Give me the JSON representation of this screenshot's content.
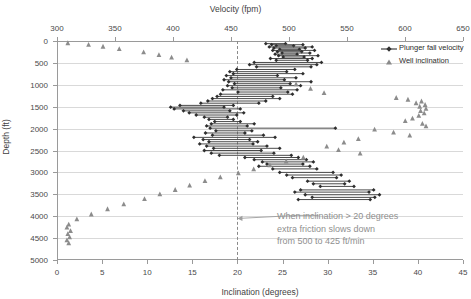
{
  "chart_data": {
    "type": "scatter",
    "title": "",
    "top_axis": {
      "label": "Velocity (fpm)",
      "ticks": [
        300,
        350,
        400,
        450,
        500,
        550,
        600,
        650
      ],
      "range": [
        300,
        650
      ]
    },
    "bottom_axis": {
      "label": "Inclination (degrees)",
      "ticks": [
        0,
        5,
        10,
        15,
        20,
        25,
        30,
        35,
        40,
        45
      ],
      "range": [
        0,
        45
      ]
    },
    "y_axis": {
      "label": "Depth (ft)",
      "ticks": [
        0,
        500,
        1000,
        1500,
        2000,
        2500,
        3000,
        3500,
        4000,
        4500,
        5000
      ],
      "range": [
        0,
        5000
      ],
      "inverted": true
    },
    "grid": true,
    "legend_position": "top-right",
    "legend": [
      {
        "name": "Plunger fall velocity",
        "marker": "line-diamond",
        "color": "#404040"
      },
      {
        "name": "Well inclination",
        "marker": "triangle",
        "color": "#808080"
      }
    ],
    "threshold_line": {
      "axis": "inclination",
      "value": 20,
      "style": "dashed"
    },
    "annotation": {
      "line1": "When inclination > 20 degrees",
      "line2": "extra friction slows down",
      "line3": "from 500 to 425 ft/min",
      "points_to_inclination": 20,
      "points_to_depth": 4050
    },
    "series": [
      {
        "name": "Plunger fall velocity",
        "x_axis": "top",
        "unit": "fpm",
        "points": [
          {
            "depth": 60,
            "v_start": 480,
            "v_end": 497
          },
          {
            "depth": 85,
            "v_start": 485,
            "v_end": 512
          },
          {
            "depth": 110,
            "v_start": 489,
            "v_end": 504
          },
          {
            "depth": 135,
            "v_start": 483,
            "v_end": 520
          },
          {
            "depth": 160,
            "v_start": 487,
            "v_end": 514
          },
          {
            "depth": 190,
            "v_start": 492,
            "v_end": 509
          },
          {
            "depth": 215,
            "v_start": 486,
            "v_end": 522
          },
          {
            "depth": 245,
            "v_start": 490,
            "v_end": 511
          },
          {
            "depth": 275,
            "v_start": 494,
            "v_end": 518
          },
          {
            "depth": 300,
            "v_start": 488,
            "v_end": 507
          },
          {
            "depth": 335,
            "v_start": 491,
            "v_end": 525
          },
          {
            "depth": 365,
            "v_start": 495,
            "v_end": 513
          },
          {
            "depth": 400,
            "v_start": 484,
            "v_end": 520
          },
          {
            "depth": 440,
            "v_start": 489,
            "v_end": 516
          },
          {
            "depth": 490,
            "v_start": 470,
            "v_end": 528
          },
          {
            "depth": 540,
            "v_start": 466,
            "v_end": 524
          },
          {
            "depth": 590,
            "v_start": 472,
            "v_end": 519
          },
          {
            "depth": 650,
            "v_start": 455,
            "v_end": 505
          },
          {
            "depth": 700,
            "v_start": 449,
            "v_end": 498
          },
          {
            "depth": 745,
            "v_start": 452,
            "v_end": 512
          },
          {
            "depth": 790,
            "v_start": 446,
            "v_end": 490
          },
          {
            "depth": 840,
            "v_start": 450,
            "v_end": 506
          },
          {
            "depth": 885,
            "v_start": 444,
            "v_end": 496
          },
          {
            "depth": 930,
            "v_start": 448,
            "v_end": 519
          },
          {
            "depth": 975,
            "v_start": 453,
            "v_end": 501
          },
          {
            "depth": 1020,
            "v_start": 447,
            "v_end": 510
          },
          {
            "depth": 1070,
            "v_start": 451,
            "v_end": 493
          },
          {
            "depth": 1115,
            "v_start": 443,
            "v_end": 507
          },
          {
            "depth": 1165,
            "v_start": 456,
            "v_end": 499
          },
          {
            "depth": 1215,
            "v_start": 441,
            "v_end": 503
          },
          {
            "depth": 1265,
            "v_start": 438,
            "v_end": 486
          },
          {
            "depth": 1315,
            "v_start": 434,
            "v_end": 492
          },
          {
            "depth": 1370,
            "v_start": 430,
            "v_end": 480
          },
          {
            "depth": 1420,
            "v_start": 424,
            "v_end": 474
          },
          {
            "depth": 1470,
            "v_start": 406,
            "v_end": 452
          },
          {
            "depth": 1510,
            "v_start": 398,
            "v_end": 444
          },
          {
            "depth": 1550,
            "v_start": 401,
            "v_end": 458
          },
          {
            "depth": 1595,
            "v_start": 409,
            "v_end": 449
          },
          {
            "depth": 1640,
            "v_start": 414,
            "v_end": 461
          },
          {
            "depth": 1690,
            "v_start": 420,
            "v_end": 455
          },
          {
            "depth": 1740,
            "v_start": 427,
            "v_end": 447
          },
          {
            "depth": 1790,
            "v_start": 431,
            "v_end": 452
          },
          {
            "depth": 1840,
            "v_start": 436,
            "v_end": 458
          },
          {
            "depth": 1890,
            "v_start": 433,
            "v_end": 470
          },
          {
            "depth": 1940,
            "v_start": 429,
            "v_end": 464
          },
          {
            "depth": 1990,
            "v_start": 432,
            "v_end": 540
          },
          {
            "depth": 2050,
            "v_start": 437,
            "v_end": 468
          },
          {
            "depth": 2100,
            "v_start": 428,
            "v_end": 462
          },
          {
            "depth": 2150,
            "v_start": 434,
            "v_end": 478
          },
          {
            "depth": 2200,
            "v_start": 418,
            "v_end": 488
          },
          {
            "depth": 2250,
            "v_start": 426,
            "v_end": 466
          },
          {
            "depth": 2300,
            "v_start": 431,
            "v_end": 473
          },
          {
            "depth": 2350,
            "v_start": 423,
            "v_end": 469
          },
          {
            "depth": 2400,
            "v_start": 429,
            "v_end": 481
          },
          {
            "depth": 2450,
            "v_start": 435,
            "v_end": 492
          },
          {
            "depth": 2500,
            "v_start": 427,
            "v_end": 476
          },
          {
            "depth": 2560,
            "v_start": 433,
            "v_end": 487
          },
          {
            "depth": 2610,
            "v_start": 440,
            "v_end": 502
          },
          {
            "depth": 2660,
            "v_start": 462,
            "v_end": 508
          },
          {
            "depth": 2710,
            "v_start": 470,
            "v_end": 515
          },
          {
            "depth": 2760,
            "v_start": 477,
            "v_end": 521
          },
          {
            "depth": 2810,
            "v_start": 481,
            "v_end": 512
          },
          {
            "depth": 2860,
            "v_start": 474,
            "v_end": 518
          },
          {
            "depth": 2920,
            "v_start": 486,
            "v_end": 524
          },
          {
            "depth": 3000,
            "v_start": 492,
            "v_end": 538
          },
          {
            "depth": 3060,
            "v_start": 498,
            "v_end": 545
          },
          {
            "depth": 3120,
            "v_start": 503,
            "v_end": 541
          },
          {
            "depth": 3200,
            "v_start": 516,
            "v_end": 552
          },
          {
            "depth": 3260,
            "v_start": 521,
            "v_end": 548
          },
          {
            "depth": 3320,
            "v_start": 527,
            "v_end": 556
          },
          {
            "depth": 3400,
            "v_start": 510,
            "v_end": 573
          },
          {
            "depth": 3450,
            "v_start": 505,
            "v_end": 569
          },
          {
            "depth": 3510,
            "v_start": 514,
            "v_end": 578
          },
          {
            "depth": 3570,
            "v_start": 520,
            "v_end": 574
          },
          {
            "depth": 3620,
            "v_start": 508,
            "v_end": 570
          }
        ]
      },
      {
        "name": "Well inclination",
        "x_axis": "bottom",
        "unit": "degrees",
        "points": [
          {
            "depth": 40,
            "inclination": 1.2
          },
          {
            "depth": 75,
            "inclination": 3.5
          },
          {
            "depth": 120,
            "inclination": 5.1
          },
          {
            "depth": 175,
            "inclination": 6.9
          },
          {
            "depth": 250,
            "inclination": 9.6
          },
          {
            "depth": 310,
            "inclination": 11.3
          },
          {
            "depth": 370,
            "inclination": 12.7
          },
          {
            "depth": 430,
            "inclination": 14.4
          },
          {
            "depth": 980,
            "inclination": 26.5
          },
          {
            "depth": 1080,
            "inclination": 28.1
          },
          {
            "depth": 1180,
            "inclination": 29.6
          },
          {
            "depth": 1290,
            "inclination": 37.6
          },
          {
            "depth": 1330,
            "inclination": 38.9
          },
          {
            "depth": 1370,
            "inclination": 40.4
          },
          {
            "depth": 1410,
            "inclination": 39.8
          },
          {
            "depth": 1450,
            "inclination": 40.8
          },
          {
            "depth": 1490,
            "inclination": 40.2
          },
          {
            "depth": 1540,
            "inclination": 40.9
          },
          {
            "depth": 1590,
            "inclination": 40.3
          },
          {
            "depth": 1640,
            "inclination": 40.7
          },
          {
            "depth": 1700,
            "inclination": 40.1
          },
          {
            "depth": 1760,
            "inclination": 39.4
          },
          {
            "depth": 1820,
            "inclination": 38.6
          },
          {
            "depth": 1880,
            "inclination": 40.5
          },
          {
            "depth": 1940,
            "inclination": 40.9
          },
          {
            "depth": 2010,
            "inclination": 35.2
          },
          {
            "depth": 2080,
            "inclination": 37.3
          },
          {
            "depth": 2150,
            "inclination": 39.1
          },
          {
            "depth": 2230,
            "inclination": 33.4
          },
          {
            "depth": 2310,
            "inclination": 31.8
          },
          {
            "depth": 2400,
            "inclination": 29.9
          },
          {
            "depth": 2480,
            "inclination": 31.2
          },
          {
            "depth": 2560,
            "inclination": 33.6
          },
          {
            "depth": 2650,
            "inclination": 27.3
          },
          {
            "depth": 2740,
            "inclination": 25.4
          },
          {
            "depth": 2830,
            "inclination": 23.6
          },
          {
            "depth": 2920,
            "inclination": 21.8
          },
          {
            "depth": 3010,
            "inclination": 20.1
          },
          {
            "depth": 3100,
            "inclination": 18.1
          },
          {
            "depth": 3190,
            "inclination": 16.4
          },
          {
            "depth": 3290,
            "inclination": 14.7
          },
          {
            "depth": 3390,
            "inclination": 13.1
          },
          {
            "depth": 3490,
            "inclination": 11.4
          },
          {
            "depth": 3600,
            "inclination": 9.7
          },
          {
            "depth": 3720,
            "inclination": 7.4
          },
          {
            "depth": 3830,
            "inclination": 5.6
          },
          {
            "depth": 3950,
            "inclination": 3.8
          },
          {
            "depth": 4060,
            "inclination": 2.2
          },
          {
            "depth": 4180,
            "inclination": 1.3
          },
          {
            "depth": 4250,
            "inclination": 1.1
          },
          {
            "depth": 4330,
            "inclination": 1.5
          },
          {
            "depth": 4400,
            "inclination": 1.2
          },
          {
            "depth": 4470,
            "inclination": 1.4
          },
          {
            "depth": 4540,
            "inclination": 1.1
          },
          {
            "depth": 4610,
            "inclination": 1.3
          }
        ]
      }
    ]
  }
}
